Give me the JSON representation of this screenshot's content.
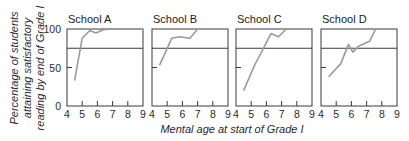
{
  "chart_data": {
    "type": "line",
    "ylabel": "Percentage of students attaining satisfactory reading by end of Grade I",
    "ylabel_lines": [
      "Percentage of students",
      "attaining satisfactory",
      "reading by end of Grade I"
    ],
    "xlabel": "Mental age at start of Grade I",
    "xlim": [
      4,
      9
    ],
    "ylim": [
      0,
      100
    ],
    "x_ticks": [
      4,
      5,
      6,
      7,
      8,
      9
    ],
    "y_ticks": [
      0,
      50,
      100
    ],
    "reference_line": 75,
    "grid": false,
    "legend": null,
    "panels": [
      {
        "title": "School A",
        "x": [
          4.5,
          5.0,
          5.5,
          5.9,
          6.4,
          7.0,
          9.0
        ],
        "y": [
          33,
          88,
          98,
          95,
          99,
          100,
          100
        ]
      },
      {
        "title": "School B",
        "x": [
          4.5,
          5.3,
          5.8,
          6.5,
          7.0,
          7.7
        ],
        "y": [
          53,
          88,
          90,
          88,
          100,
          100
        ]
      },
      {
        "title": "School C",
        "x": [
          4.5,
          5.2,
          5.8,
          6.3,
          6.8,
          7.3,
          7.8
        ],
        "y": [
          20,
          52,
          75,
          94,
          90,
          100,
          100
        ]
      },
      {
        "title": "School D",
        "x": [
          4.5,
          5.3,
          5.8,
          6.1,
          6.5,
          7.2,
          7.6
        ],
        "y": [
          38,
          55,
          80,
          70,
          78,
          84,
          100
        ]
      }
    ]
  },
  "colors": {
    "axis": "#3a3a3a",
    "line": "#9a9a9a",
    "text": "#2a2a2a"
  }
}
